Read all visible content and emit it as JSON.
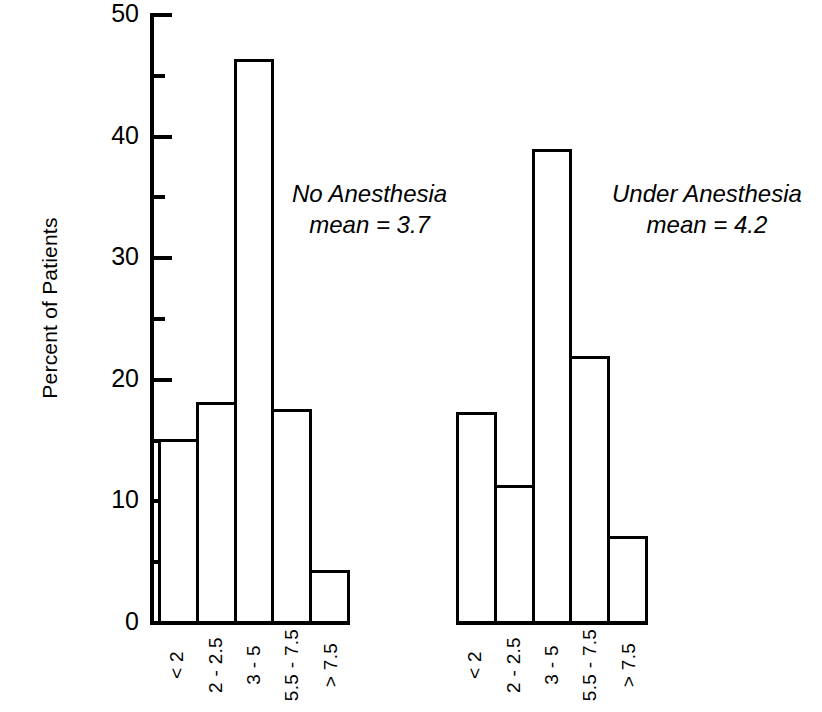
{
  "chart_data": {
    "type": "bar",
    "title": "",
    "subtitle": "",
    "xlabel": "",
    "ylabel": "Percent of Patients",
    "ylim": [
      0,
      50
    ],
    "y_ticks_major": [
      0,
      10,
      20,
      30,
      40,
      50
    ],
    "y_ticks_minor": [
      5,
      15,
      25,
      35,
      45
    ],
    "grid": false,
    "legend_position": "none",
    "categories": [
      "< 2",
      "2 - 2.5",
      "3 - 5",
      "5.5 - 7.5",
      "> 7.5"
    ],
    "panels": [
      {
        "name": "No Anesthesia",
        "annotation_line1": "No Anesthesia",
        "annotation_line2": "mean = 3.7",
        "mean": 3.7,
        "values": [
          15.0,
          18.0,
          46.2,
          17.4,
          4.2
        ]
      },
      {
        "name": "Under Anesthesia",
        "annotation_line1": "Under Anesthesia",
        "annotation_line2": "mean = 4.2",
        "mean": 4.2,
        "values": [
          17.2,
          11.2,
          38.8,
          21.8,
          7.0
        ]
      }
    ],
    "series": [
      {
        "name": "No Anesthesia",
        "values": [
          15.0,
          18.0,
          46.2,
          17.4,
          4.2
        ]
      },
      {
        "name": "Under Anesthesia",
        "values": [
          17.2,
          11.2,
          38.8,
          21.8,
          7.0
        ]
      }
    ],
    "colors": {
      "bar_fill": "#ffffff",
      "bar_stroke": "#000000",
      "axis": "#000000",
      "text": "#000000",
      "background": "#ffffff"
    }
  },
  "axis": {
    "y_title": "Percent of Patients",
    "tick_labels": {
      "t0": "0",
      "t10": "10",
      "t20": "20",
      "t30": "30",
      "t40": "40",
      "t50": "50"
    }
  },
  "left_panel": {
    "annotation_line1": "No Anesthesia",
    "annotation_line2": "mean = 3.7",
    "xlabels": [
      "< 2",
      "2 - 2.5",
      "3 - 5",
      "5.5 - 7.5",
      "> 7.5"
    ]
  },
  "right_panel": {
    "annotation_line1": "Under Anesthesia",
    "annotation_line2": "mean = 4.2",
    "xlabels": [
      "< 2",
      "2 - 2.5",
      "3 - 5",
      "5.5 - 7.5",
      "> 7.5"
    ]
  }
}
